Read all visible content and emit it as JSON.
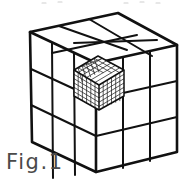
{
  "figure": {
    "caption": "Fig.1",
    "title_visible": false,
    "line_color": "#111111",
    "fill_color": "#ffffff",
    "background_color": "#ffffff",
    "caption_color": "#4a4a4a",
    "big_cube": {
      "divisions_per_edge": 3,
      "visible_faces": [
        "top",
        "left",
        "right"
      ],
      "cells_per_visible_face": 9
    },
    "small_cube": {
      "divisions_per_edge": 6,
      "position": "on top face, middle-left cell",
      "visible_faces": [
        "top",
        "left",
        "right"
      ]
    },
    "geometry": {
      "top_vertex": [
        118,
        13
      ],
      "left_vertex": [
        30,
        32
      ],
      "right_vertex": [
        177,
        45
      ],
      "center_top_front": [
        96,
        63
      ],
      "left_bottom_vertex": [
        32,
        142
      ],
      "bottom_vertex": [
        96,
        172
      ],
      "right_bottom_vertex": [
        177,
        152
      ]
    }
  }
}
